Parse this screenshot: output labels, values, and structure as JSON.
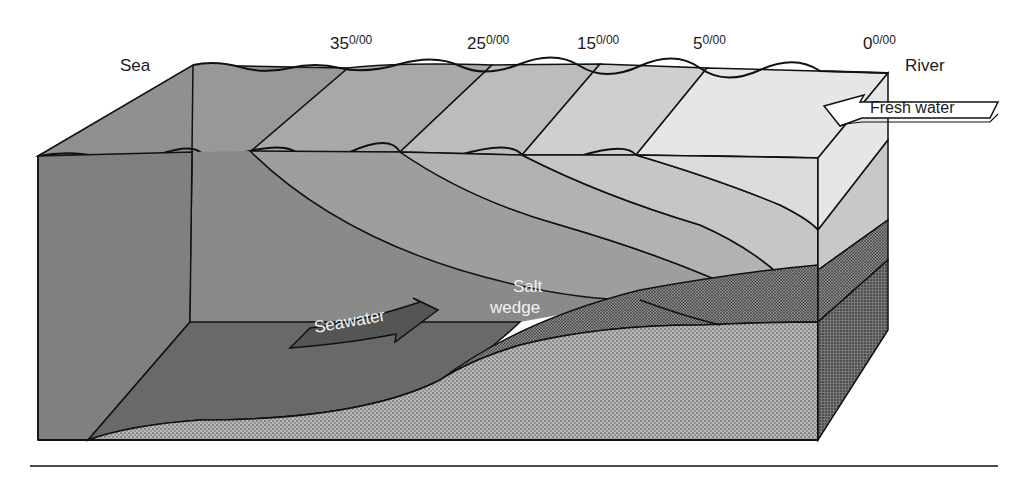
{
  "diagram": {
    "labels": {
      "sea": "Sea",
      "river": "River",
      "fresh_water": "Fresh water",
      "seawater": "Seawater",
      "salt_wedge_line1": "Salt",
      "salt_wedge_line2": "wedge"
    },
    "salinity_labels": [
      {
        "value": "35",
        "unit": "0/00"
      },
      {
        "value": "25",
        "unit": "0/00"
      },
      {
        "value": "15",
        "unit": "0/00"
      },
      {
        "value": "5",
        "unit": "0/00"
      },
      {
        "value": "0",
        "unit": "0/00"
      }
    ],
    "colors": {
      "zone_35": "#8a8a8a",
      "zone_25": "#a2a2a2",
      "zone_15": "#b8b8b8",
      "zone_5": "#cfcfcf",
      "zone_0": "#e8e8e8",
      "seafloor": "#6a6a6a",
      "sediment": "#b5b5b5",
      "sediment_dark": "#777777",
      "outline": "#111111"
    }
  }
}
